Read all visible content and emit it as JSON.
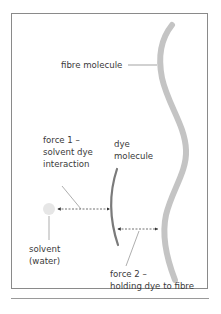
{
  "diagram": {
    "labels": {
      "fibre": "fibre molecule",
      "force1_l1": "force 1 –",
      "force1_l2": "solvent dye",
      "force1_l3": "interaction",
      "dye_l1": "dye",
      "dye_l2": "molecule",
      "solvent_l1": "solvent",
      "solvent_l2": "(water)",
      "force2_l1": "force 2 –",
      "force2_l2": "holding dye to fibre"
    },
    "colors": {
      "fibre": "#c4c4c4",
      "dye": "#7a7a7a",
      "solvent": "#e6e6e6",
      "text": "#3a3a3a",
      "frame": "#8a8a8a"
    }
  }
}
